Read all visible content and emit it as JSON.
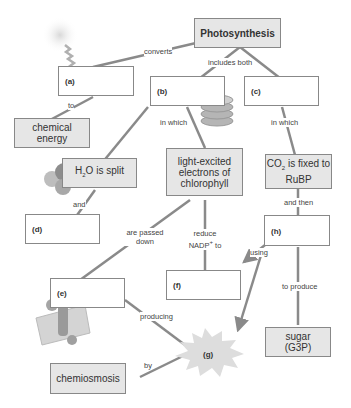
{
  "title": "Photosynthesis",
  "nodes": {
    "a": "(a)",
    "b": "(b)",
    "c": "(c)",
    "d": "(d)",
    "e": "(e)",
    "f": "(f)",
    "g": "(g)",
    "h": "(h)",
    "chemical_energy": "chemical energy",
    "h2o_split_pre": "H",
    "h2o_split_sub": "2",
    "h2o_split_post": "O is split",
    "light_excited": "light-excited electrons of chlorophyll",
    "co2_pre": "CO",
    "co2_sub": "2",
    "co2_post": " is fixed to RuBP",
    "chemiosmosis": "chemiosmosis",
    "sugar": "sugar (G3P)"
  },
  "links": {
    "converts": "converts",
    "to": "to",
    "includes_both": "includes both",
    "in_which_left": "in which",
    "in_which_right": "in which",
    "and": "and",
    "are_passed_down": "are passed down",
    "reduce_pre": "reduce NADP",
    "reduce_sup": "+",
    "reduce_post": " to",
    "and_then": "and then",
    "using": "using",
    "to_produce": "to produce",
    "producing": "producing",
    "by": "by"
  },
  "colors": {
    "line": "#8a8a8a",
    "filled_box": "#e6e6e6",
    "border": "#888888",
    "burst": "#dddddd"
  }
}
